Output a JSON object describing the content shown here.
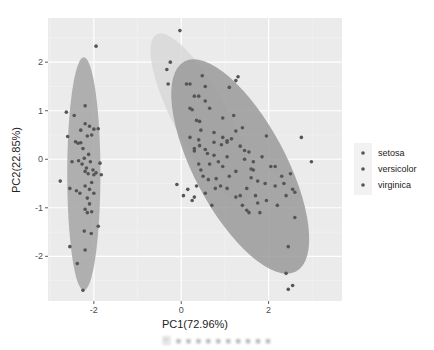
{
  "chart_data": {
    "type": "scatter",
    "title": "",
    "xlabel": "PC1(72.96%)",
    "ylabel": "PC2(22.85%)",
    "xlim": [
      -3.05,
      3.68
    ],
    "ylim": [
      -2.92,
      2.91
    ],
    "x_ticks": [
      -2,
      0,
      2
    ],
    "y_ticks": [
      -2,
      -1,
      0,
      1,
      2
    ],
    "grid": true,
    "legend_position": "right",
    "legend": [
      "setosa",
      "versicolor",
      "virginica"
    ],
    "colors": {
      "panel_bg": "#ebebeb",
      "grid_major": "#ffffff",
      "grid_minor": "#f4f4f4",
      "setosa_ellipse": "#a9a9a9",
      "versicolor_ellipse": "#d6d6d6",
      "virginica_ellipse": "#9a9a9a",
      "point": "#555555"
    },
    "ellipses": [
      {
        "name": "setosa",
        "cx": -2.23,
        "cy": -0.3,
        "rx": 0.38,
        "ry": 2.4,
        "angle": 0
      },
      {
        "name": "versicolor",
        "cx": 0.45,
        "cy": 0.85,
        "rx": 0.62,
        "ry": 1.95,
        "angle": -28
      },
      {
        "name": "virginica",
        "cx": 1.35,
        "cy": -0.15,
        "rx": 1.05,
        "ry": 2.45,
        "angle": -28
      }
    ],
    "series": [
      {
        "name": "setosa",
        "points": [
          [
            -1.95,
            2.33
          ],
          [
            -2.63,
            0.97
          ],
          [
            -2.45,
            0.9
          ],
          [
            -2.2,
            1.1
          ],
          [
            -2.6,
            0.47
          ],
          [
            -2.42,
            0.36
          ],
          [
            -2.36,
            0.33
          ],
          [
            -2.3,
            0.6
          ],
          [
            -2.2,
            0.73
          ],
          [
            -2.1,
            0.68
          ],
          [
            -2.15,
            0.48
          ],
          [
            -2.05,
            0.5
          ],
          [
            -2.0,
            0.62
          ],
          [
            -1.9,
            0.63
          ],
          [
            -2.3,
            0.34
          ],
          [
            -2.25,
            0.22
          ],
          [
            -2.22,
            0.02
          ],
          [
            -2.12,
            0.1
          ],
          [
            -2.08,
            -0.05
          ],
          [
            -1.86,
            -0.08
          ],
          [
            -2.5,
            -0.05
          ],
          [
            -2.35,
            -0.03
          ],
          [
            -2.27,
            -0.1
          ],
          [
            -2.17,
            -0.18
          ],
          [
            -2.2,
            -0.25
          ],
          [
            -2.13,
            -0.3
          ],
          [
            -2.02,
            -0.22
          ],
          [
            -2.0,
            -0.32
          ],
          [
            -1.95,
            -0.28
          ],
          [
            -1.83,
            -0.32
          ],
          [
            -2.77,
            -0.45
          ],
          [
            -2.55,
            -0.6
          ],
          [
            -2.4,
            -0.65
          ],
          [
            -2.32,
            -0.7
          ],
          [
            -2.2,
            -0.55
          ],
          [
            -2.1,
            -0.62
          ],
          [
            -2.05,
            -0.48
          ],
          [
            -2.0,
            -0.7
          ],
          [
            -2.15,
            -0.8
          ],
          [
            -2.1,
            -0.92
          ],
          [
            -2.2,
            -1.03
          ],
          [
            -2.15,
            -1.1
          ],
          [
            -2.05,
            -1.08
          ],
          [
            -1.9,
            -1.38
          ],
          [
            -2.22,
            -1.48
          ],
          [
            -2.06,
            -1.53
          ],
          [
            -2.55,
            -1.8
          ],
          [
            -2.2,
            -1.87
          ],
          [
            -2.38,
            -2.15
          ],
          [
            -2.25,
            -2.7
          ]
        ]
      },
      {
        "name": "versicolor",
        "points": [
          [
            -0.03,
            2.65
          ],
          [
            -0.25,
            2.0
          ],
          [
            -0.33,
            1.85
          ],
          [
            -0.3,
            1.55
          ],
          [
            0.12,
            1.55
          ],
          [
            0.2,
            1.55
          ],
          [
            0.3,
            1.3
          ],
          [
            0.2,
            1.05
          ],
          [
            0.25,
            1.02
          ],
          [
            0.35,
            0.8
          ],
          [
            0.42,
            0.78
          ],
          [
            0.45,
            0.6
          ],
          [
            0.2,
            0.45
          ],
          [
            0.4,
            0.4
          ],
          [
            0.42,
            0.28
          ],
          [
            0.3,
            0.22
          ],
          [
            0.3,
            0.17
          ],
          [
            0.55,
            0.2
          ],
          [
            0.6,
            0.12
          ],
          [
            0.75,
            0.08
          ],
          [
            0.85,
            -0.05
          ],
          [
            0.65,
            -0.1
          ],
          [
            0.45,
            -0.22
          ],
          [
            0.5,
            -0.35
          ],
          [
            0.62,
            -0.42
          ],
          [
            0.8,
            -0.4
          ],
          [
            0.95,
            -0.15
          ],
          [
            1.05,
            0.05
          ],
          [
            0.92,
            0.3
          ],
          [
            0.75,
            0.35
          ],
          [
            0.95,
            0.45
          ],
          [
            1.05,
            0.38
          ],
          [
            0.55,
            1.2
          ],
          [
            0.4,
            1.3
          ],
          [
            0.55,
            1.5
          ],
          [
            0.48,
            1.72
          ],
          [
            0.65,
            1.05
          ],
          [
            0.95,
            0.85
          ],
          [
            0.75,
            0.55
          ],
          [
            0.35,
            -0.55
          ],
          [
            0.15,
            -0.62
          ],
          [
            0.05,
            -0.75
          ],
          [
            -0.1,
            -0.52
          ],
          [
            0.25,
            -0.85
          ],
          [
            0.3,
            -0.78
          ],
          [
            0.78,
            -0.6
          ],
          [
            0.9,
            -0.55
          ],
          [
            0.55,
            -0.7
          ],
          [
            0.7,
            -0.95
          ],
          [
            0.4,
            -0.1
          ]
        ]
      },
      {
        "name": "virginica",
        "points": [
          [
            1.3,
            1.7
          ],
          [
            1.25,
            1.62
          ],
          [
            1.1,
            1.48
          ],
          [
            1.2,
            0.9
          ],
          [
            1.4,
            0.65
          ],
          [
            1.25,
            0.58
          ],
          [
            1.15,
            0.42
          ],
          [
            1.05,
            0.35
          ],
          [
            1.35,
            0.27
          ],
          [
            1.45,
            0.18
          ],
          [
            1.55,
            0.15
          ],
          [
            1.6,
            -0.2
          ],
          [
            1.65,
            -0.22
          ],
          [
            1.95,
            0.48
          ],
          [
            2.15,
            -0.15
          ],
          [
            2.5,
            -0.3
          ],
          [
            2.98,
            -0.05
          ],
          [
            2.55,
            -0.62
          ],
          [
            2.6,
            -0.68
          ],
          [
            1.92,
            -0.5
          ],
          [
            1.75,
            -0.45
          ],
          [
            1.6,
            -0.38
          ],
          [
            1.5,
            -0.6
          ],
          [
            1.35,
            -0.75
          ],
          [
            1.25,
            -0.78
          ],
          [
            1.4,
            -0.95
          ],
          [
            1.5,
            -1.05
          ],
          [
            1.55,
            -1.1
          ],
          [
            1.8,
            -1.1
          ],
          [
            1.95,
            -0.85
          ],
          [
            2.2,
            -0.95
          ],
          [
            2.15,
            -0.55
          ],
          [
            2.35,
            -0.5
          ],
          [
            2.4,
            -0.75
          ],
          [
            2.6,
            -1.2
          ],
          [
            1.65,
            -0.05
          ],
          [
            1.45,
            0.0
          ],
          [
            1.25,
            -0.25
          ],
          [
            1.1,
            -0.35
          ],
          [
            1.05,
            -0.6
          ],
          [
            2.3,
            -0.35
          ],
          [
            2.05,
            -0.15
          ],
          [
            1.85,
            0.05
          ],
          [
            2.75,
            0.45
          ],
          [
            1.7,
            -0.75
          ],
          [
            1.75,
            -0.9
          ],
          [
            2.45,
            -1.8
          ],
          [
            2.4,
            -2.35
          ],
          [
            2.55,
            -2.6
          ],
          [
            2.45,
            -2.68
          ]
        ]
      }
    ]
  },
  "axes": {
    "x_title": "PC1(72.96%)",
    "y_title": "PC2(22.85%)",
    "x_tick_labels": [
      "-2",
      "0",
      "2"
    ],
    "y_tick_labels": [
      "2",
      "1",
      "0",
      "-1",
      "-2"
    ]
  },
  "legend": {
    "items": [
      {
        "label": "setosa"
      },
      {
        "label": "versicolor"
      },
      {
        "label": "virginica"
      }
    ]
  },
  "caption": "图 ■ ■ ■ ■ ■ ■ ■ ■ ■ ■"
}
